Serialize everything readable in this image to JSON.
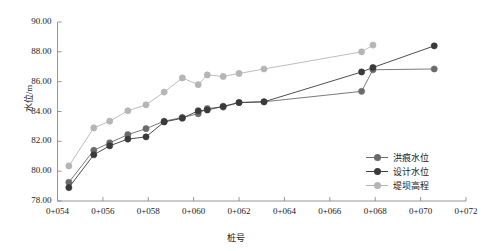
{
  "chart_data": {
    "type": "line",
    "title": "",
    "xlabel": "桩号",
    "ylabel": "水位/m",
    "ylim": [
      78.0,
      90.0
    ],
    "yticks": [
      "78.00",
      "80.00",
      "82.00",
      "84.00",
      "86.00",
      "88.00",
      "90.00"
    ],
    "ytick_values": [
      78.0,
      80.0,
      82.0,
      84.0,
      86.0,
      88.0,
      90.0
    ],
    "xticks": [
      "0+054",
      "0+056",
      "0+058",
      "0+060",
      "0+062",
      "0+064",
      "0+066",
      "0+068",
      "0+070",
      "0+072"
    ],
    "xtick_values": [
      54,
      56,
      58,
      60,
      62,
      64,
      66,
      68,
      70,
      72
    ],
    "xlim": [
      54,
      72
    ],
    "grid": false,
    "legend_position": "lower right",
    "series": [
      {
        "name": "洪痕水位",
        "color": "#6b6b6b",
        "marker": "circle",
        "x": [
          54.5,
          55.6,
          56.3,
          57.1,
          57.9,
          58.7,
          59.5,
          60.2,
          60.6,
          61.3,
          62.0,
          63.1,
          67.4,
          67.9,
          70.6
        ],
        "values": [
          79.25,
          81.4,
          81.9,
          82.45,
          82.85,
          83.35,
          83.6,
          83.85,
          84.2,
          84.3,
          84.6,
          84.65,
          85.35,
          86.8,
          86.85
        ]
      },
      {
        "name": "设计水位",
        "color": "#3a3a3a",
        "marker": "circle",
        "x": [
          54.5,
          55.6,
          56.3,
          57.1,
          57.9,
          58.7,
          59.5,
          60.2,
          60.6,
          61.3,
          62.0,
          63.1,
          67.4,
          67.9,
          70.6
        ],
        "values": [
          78.9,
          81.1,
          81.7,
          82.15,
          82.3,
          83.3,
          83.55,
          84.05,
          84.1,
          84.35,
          84.6,
          84.65,
          86.65,
          86.95,
          88.4
        ]
      },
      {
        "name": "堤坝高程",
        "color": "#b5b5b5",
        "marker": "circle",
        "x": [
          54.5,
          55.6,
          56.3,
          57.1,
          57.9,
          58.7,
          59.5,
          60.2,
          60.6,
          61.3,
          62.0,
          63.1,
          67.4,
          67.9
        ],
        "values": [
          80.35,
          82.9,
          83.35,
          84.05,
          84.45,
          85.3,
          86.25,
          85.8,
          86.45,
          86.35,
          86.55,
          86.85,
          88.0,
          88.45
        ]
      }
    ]
  },
  "axes": {
    "ylabel": "水位/m",
    "xlabel": "桩号"
  },
  "legend": {
    "items": [
      {
        "label": "洪痕水位",
        "color": "#6b6b6b"
      },
      {
        "label": "设计水位",
        "color": "#3a3a3a"
      },
      {
        "label": "堤坝高程",
        "color": "#b5b5b5"
      }
    ]
  },
  "style": {
    "axis_color": "#8a8a8a",
    "text_color": "#222222",
    "background": "#ffffff"
  }
}
